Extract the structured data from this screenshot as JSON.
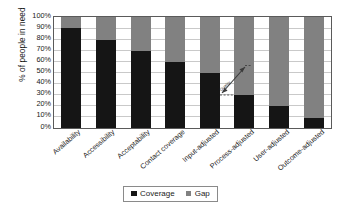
{
  "chart_data": {
    "type": "bar",
    "stacked": true,
    "title": "",
    "subtitle": "",
    "xlabel": "",
    "ylabel": "% of people in need",
    "ylim": [
      0,
      100
    ],
    "ytick_labels": [
      "100%",
      "90%",
      "80%",
      "70%",
      "60%",
      "50%",
      "40%",
      "30%",
      "20%",
      "10%",
      "0%"
    ],
    "ytick_values": [
      100,
      90,
      80,
      70,
      60,
      50,
      40,
      30,
      20,
      10,
      0
    ],
    "grid": true,
    "legend_position": "bottom-center",
    "categories": [
      "Availability",
      "Accessibility",
      "Acceptability",
      "Contact coverage",
      "Input-adjusted",
      "Process-adjusted",
      "User-adjusted",
      "Outcome-adjusted"
    ],
    "series": [
      {
        "name": "Coverage",
        "color": "#151515",
        "values": [
          90,
          79,
          69,
          59,
          49,
          29,
          19,
          9
        ]
      },
      {
        "name": "Gap",
        "color": "#818181",
        "values": [
          10,
          21,
          31,
          41,
          51,
          71,
          81,
          91
        ]
      }
    ],
    "annotations": [
      {
        "name": "quality-gap-arrow",
        "label": "Quality",
        "type": "double-headed-arrow"
      }
    ]
  },
  "legend": {
    "items": [
      {
        "label": "Coverage",
        "color": "#151515"
      },
      {
        "label": "Gap",
        "color": "#818181"
      }
    ]
  }
}
